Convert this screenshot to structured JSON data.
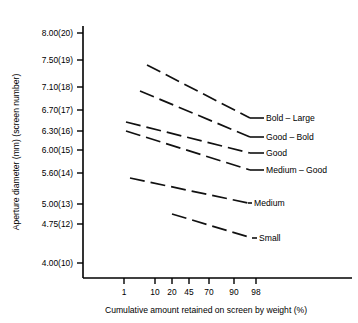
{
  "chart_data": {
    "type": "line",
    "title": "",
    "xlabel": "Cumulative amount retained on screen by weight (%)",
    "ylabel": "Aperture diameter (mm) (screen number)",
    "grid": false,
    "legend_position": "right-inline",
    "x_tick_labels": [
      "1",
      "10",
      "20",
      "45",
      "70",
      "90",
      "98"
    ],
    "x_tick_values": [
      1,
      10,
      20,
      45,
      70,
      90,
      98
    ],
    "y_tick_labels": [
      "8.00(20)",
      "7.50(19)",
      "7.10(18)",
      "6.70(17)",
      "6.30(16)",
      "6.00(15)",
      "5.60(14)",
      "5.00(13)",
      "4.75(12)",
      "4.00(10)"
    ],
    "y_tick_values": [
      8.0,
      7.5,
      7.1,
      6.7,
      6.3,
      6.0,
      5.6,
      5.0,
      4.75,
      4.0
    ],
    "y_screen_numbers": [
      20,
      19,
      18,
      17,
      16,
      15,
      14,
      13,
      12,
      10
    ],
    "ylim": [
      4.0,
      8.0
    ],
    "series": [
      {
        "name": "Bold – Large",
        "x": [
          7,
          98
        ],
        "y": [
          7.42,
          6.42
        ],
        "style": "dashed"
      },
      {
        "name": "Good – Bold",
        "x": [
          6,
          98
        ],
        "y": [
          7.04,
          6.05
        ],
        "style": "dashed"
      },
      {
        "name": "Good",
        "x": [
          4,
          98
        ],
        "y": [
          6.47,
          5.7
        ],
        "style": "dashed"
      },
      {
        "name": "Medium – Good",
        "x": [
          4,
          98
        ],
        "y": [
          6.34,
          5.52
        ],
        "style": "dashed"
      },
      {
        "name": "Medium",
        "x": [
          5,
          98
        ],
        "y": [
          5.52,
          4.88
        ],
        "style": "dashed"
      },
      {
        "name": "Small",
        "x": [
          20,
          98
        ],
        "y": [
          5.04,
          4.58
        ],
        "style": "dashed"
      }
    ]
  },
  "geometry": {
    "plot_left": 83,
    "plot_bottom": 278,
    "plot_right": 352,
    "plot_top": 26,
    "y_pixels": [
      33,
      60,
      87,
      110,
      131,
      150,
      173,
      204,
      224,
      263
    ],
    "x_pixels": [
      124,
      155,
      172,
      189,
      209,
      234,
      256
    ],
    "series_pixels": [
      {
        "x1": 147,
        "y1": 65,
        "x2": 250,
        "y2": 118,
        "lx": 266,
        "ly": 121
      },
      {
        "x1": 140,
        "y1": 91,
        "x2": 250,
        "y2": 137,
        "lx": 266,
        "ly": 140
      },
      {
        "x1": 126,
        "y1": 122,
        "x2": 250,
        "y2": 153,
        "lx": 266,
        "ly": 156
      },
      {
        "x1": 126,
        "y1": 131,
        "x2": 250,
        "y2": 170,
        "lx": 266,
        "ly": 173
      },
      {
        "x1": 130,
        "y1": 178,
        "x2": 248,
        "y2": 203,
        "lx": 254,
        "ly": 206
      },
      {
        "x1": 172,
        "y1": 214,
        "x2": 252,
        "y2": 238,
        "lx": 259,
        "ly": 241
      }
    ]
  },
  "axis_titles": {
    "x": "Cumulative amount retained on screen by weight (%)",
    "y": "Aperture diameter (mm) (screen number)"
  }
}
